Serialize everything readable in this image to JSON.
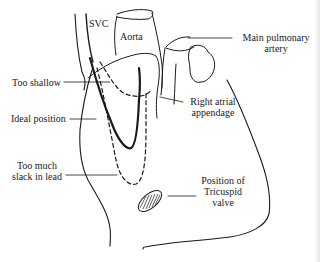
{
  "diagram": {
    "colors": {
      "line": "#1a1a1a",
      "background": "#ffffff"
    },
    "labels": {
      "svc": "SVC",
      "aorta": "Aorta",
      "main_pulmonary_artery_line1": "Main pulmonary",
      "main_pulmonary_artery_line2": "artery",
      "too_shallow": "Too shallow",
      "ideal_position": "Ideal position",
      "right_atrial_appendage_line1": "Right atrial",
      "right_atrial_appendage_line2": "appendage",
      "too_much_slack_line1": "Too much",
      "too_much_slack_line2": "slack in lead",
      "tricuspid_line1": "Position of",
      "tricuspid_line2": "Tricuspid",
      "tricuspid_line3": "valve"
    }
  }
}
